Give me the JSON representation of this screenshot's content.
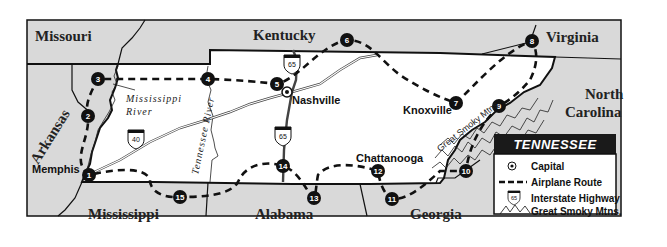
{
  "map": {
    "title": "TENNESSEE",
    "neighbor_states": [
      {
        "name": "Missouri",
        "x": 60,
        "y": 40
      },
      {
        "name": "Kentucky",
        "x": 255,
        "y": 38
      },
      {
        "name": "Virginia",
        "x": 545,
        "y": 38
      },
      {
        "name": "North",
        "x": 601,
        "y": 97
      },
      {
        "name": "Carolina",
        "x": 601,
        "y": 115
      },
      {
        "name": "Arkansas",
        "x": 42,
        "y": 140
      },
      {
        "name": "Mississippi",
        "x": 120,
        "y": 219
      },
      {
        "name": "Alabama",
        "x": 284,
        "y": 219
      },
      {
        "name": "Georgia",
        "x": 440,
        "y": 219
      }
    ],
    "cities": [
      {
        "name": "Nashville",
        "x": 292,
        "y": 106
      },
      {
        "name": "Knoxville",
        "x": 398,
        "y": 113
      },
      {
        "name": "Chattanooga",
        "x": 355,
        "y": 162
      },
      {
        "name": "Memphis",
        "x": 14,
        "y": 175
      }
    ],
    "rivers": [
      {
        "name_line1": "Mississippi",
        "name_line2": "River"
      },
      {
        "name": "Tennessee River"
      }
    ],
    "mountains_label": "Great Smoky Mtns.",
    "interstates": [
      "40",
      "65",
      "65"
    ],
    "route_stops": [
      {
        "n": "1",
        "x": 89,
        "y": 175
      },
      {
        "n": "2",
        "x": 88,
        "y": 116
      },
      {
        "n": "3",
        "x": 98,
        "y": 79
      },
      {
        "n": "4",
        "x": 208,
        "y": 79
      },
      {
        "n": "5",
        "x": 277,
        "y": 84
      },
      {
        "n": "6",
        "x": 347,
        "y": 40
      },
      {
        "n": "7",
        "x": 456,
        "y": 103
      },
      {
        "n": "8",
        "x": 532,
        "y": 41
      },
      {
        "n": "9",
        "x": 499,
        "y": 106
      },
      {
        "n": "10",
        "x": 466,
        "y": 171
      },
      {
        "n": "11",
        "x": 392,
        "y": 199
      },
      {
        "n": "12",
        "x": 378,
        "y": 171
      },
      {
        "n": "13",
        "x": 314,
        "y": 198
      },
      {
        "n": "14",
        "x": 283,
        "y": 166
      },
      {
        "n": "15",
        "x": 180,
        "y": 197
      }
    ]
  },
  "legend": {
    "title": "TENNESSEE",
    "items": [
      {
        "icon": "capital-icon",
        "label": "Capital"
      },
      {
        "icon": "airplane-route-icon",
        "label": "Airplane Route"
      },
      {
        "icon": "interstate-shield-icon",
        "label": "Interstate Highway",
        "shield": "65"
      },
      {
        "icon": "mountains-icon",
        "label": "Great Smoky Mtns."
      }
    ]
  },
  "colors": {
    "neighbor_fill": "#d9d9d9",
    "tn_fill": "#ffffff",
    "legend_header": "#1a1a1a"
  }
}
